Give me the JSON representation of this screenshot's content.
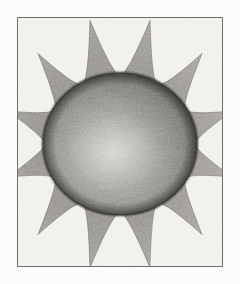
{
  "artwork": {
    "title": "Sun",
    "medium": "graphite pencil drawing on paper",
    "subject": "sun-with-rays",
    "caption": "",
    "paper_color": "#fdfdfc",
    "canvas": {
      "width": 240,
      "height": 284
    }
  },
  "frame": {
    "name": "rectangular-border",
    "x": 17,
    "y": 17,
    "width": 206,
    "height": 250,
    "stroke_color": "#6f6f72",
    "stroke_width": 1,
    "fill_color": "#f6f5f2"
  },
  "corona": {
    "name": "sun-rays",
    "ray_count": 12,
    "inner_radius_x": 76,
    "inner_radius_y": 70,
    "outer_radius_x": 116,
    "outer_radius_y": 128,
    "fill_color": "#9a9791",
    "edge_color": "#7d7a75",
    "tip_rotation_deg": 15
  },
  "disc": {
    "name": "sun-disc",
    "center_x": 120,
    "center_y": 144,
    "radius_x": 77,
    "radius_y": 71,
    "fill_color": "#8c8983",
    "rim_color": "#3a3834",
    "rim_width": 1.6,
    "shadow_color": "#4e4b47",
    "highlight_color": "#d2d0c9",
    "highlight_center_x": 113,
    "highlight_center_y": 152,
    "highlight_radius": 46
  },
  "texture": {
    "name": "graphite-grain",
    "grain_opacity": 0.42,
    "grain_color": "#3c3a36",
    "paper_grain_opacity": 0.16
  },
  "tones": {
    "paper_white": "#fdfdfc",
    "inner_paper": "#f4f3ef",
    "corona_mid": "#9a9791",
    "corona_light": "#b5b2ab",
    "disc_mid": "#8c8983",
    "disc_dark": "#46443f",
    "disc_light": "#d5d3cc",
    "border_gray": "#6f6f72"
  }
}
